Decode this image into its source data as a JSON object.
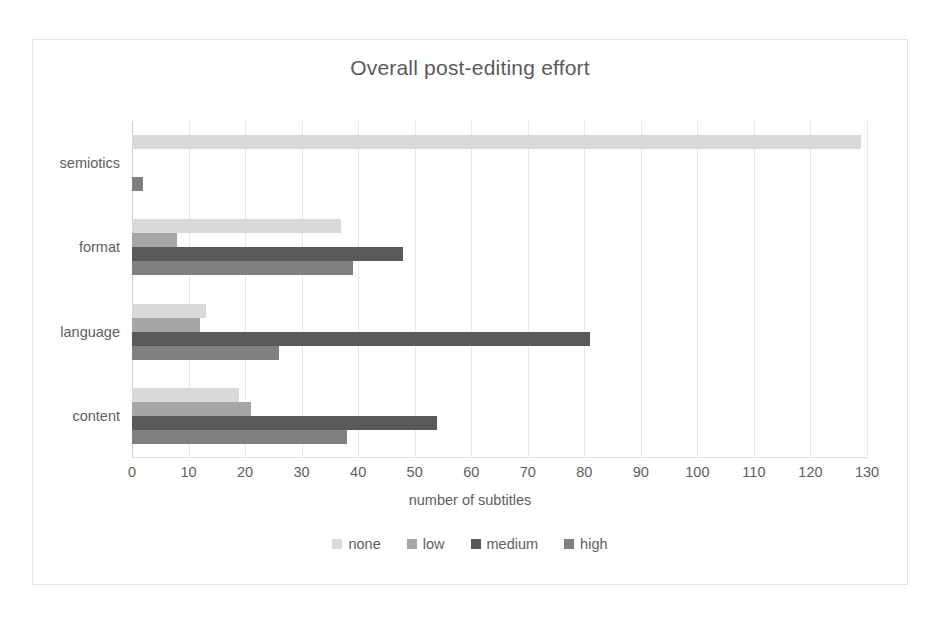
{
  "chart_data": {
    "type": "bar",
    "orientation": "horizontal",
    "title": "Overall post-editing effort",
    "xlabel": "number of subtitles",
    "ylabel": "",
    "xlim": [
      0,
      130
    ],
    "xticks": [
      0,
      10,
      20,
      30,
      40,
      50,
      60,
      70,
      80,
      90,
      100,
      110,
      120,
      130
    ],
    "grid": true,
    "legend_position": "bottom",
    "categories": [
      "content",
      "language",
      "format",
      "semiotics"
    ],
    "categories_top_to_bottom": [
      "semiotics",
      "format",
      "language",
      "content"
    ],
    "series": [
      {
        "name": "none",
        "color": "#d9d9d9",
        "values": [
          19,
          13,
          37,
          129
        ]
      },
      {
        "name": "low",
        "color": "#a6a6a6",
        "values": [
          21,
          12,
          8,
          0
        ]
      },
      {
        "name": "medium",
        "color": "#595959",
        "values": [
          54,
          81,
          48,
          0
        ]
      },
      {
        "name": "high",
        "color": "#808080",
        "values": [
          38,
          26,
          39,
          2
        ]
      }
    ]
  },
  "chart": {
    "title": "Overall post-editing effort",
    "x_axis_title": "number of subtitles",
    "x_tick_labels": [
      "0",
      "10",
      "20",
      "30",
      "40",
      "50",
      "60",
      "70",
      "80",
      "90",
      "100",
      "110",
      "120",
      "130"
    ],
    "category_labels": [
      "semiotics",
      "format",
      "language",
      "content"
    ],
    "legend": [
      {
        "label": "none",
        "color": "#d9d9d9"
      },
      {
        "label": "low",
        "color": "#a6a6a6"
      },
      {
        "label": "medium",
        "color": "#595959"
      },
      {
        "label": "high",
        "color": "#808080"
      }
    ]
  }
}
